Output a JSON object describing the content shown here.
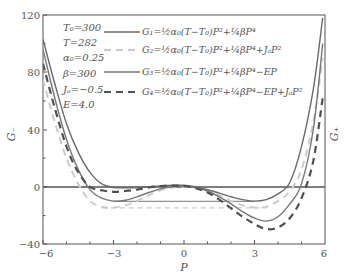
{
  "chart_data": {
    "type": "line",
    "title": "",
    "xlabel": "P",
    "ylabel": "G_",
    "ylabel_right": "G+",
    "xlim": [
      -6,
      6
    ],
    "ylim": [
      -40,
      120
    ],
    "xticks": [
      -6,
      -3,
      0,
      3,
      6
    ],
    "yticks": [
      -40,
      0,
      40,
      80,
      120
    ],
    "grid": false,
    "legend_position": "top-center",
    "parameters": [
      {
        "label": "T₀=300"
      },
      {
        "label": "T=282"
      },
      {
        "label": "α₀=0.25"
      },
      {
        "label": "β=300"
      },
      {
        "label": "Jₐ=−0.5"
      },
      {
        "label": "E=4.0"
      }
    ],
    "series": [
      {
        "name": "G₁ = ½α₀(T−T₀)P² + ¼βP⁴",
        "style": "solid",
        "color": "#666666",
        "x": [
          -6,
          -5.5,
          -5,
          -4.5,
          -4,
          -3.5,
          -3,
          -2.5,
          -2,
          -1.5,
          -1,
          -0.5,
          0,
          0.5,
          1,
          1.5,
          2,
          2.5,
          3,
          3.5,
          4,
          4.5,
          5,
          5.5,
          5.9
        ],
        "values": [
          103,
          72,
          44,
          24,
          10,
          2,
          -0.5,
          -0.8,
          -0.5,
          0,
          0.6,
          1,
          1,
          0,
          -2,
          -4.5,
          -7,
          -9,
          -10,
          -9,
          -5,
          3,
          28,
          68,
          118
        ]
      },
      {
        "name": "G₂ = ½α₀(T−T₀)P² + ¼βP⁴ + JₐP²",
        "style": "dashed",
        "color": "#c8c8c8",
        "x": [
          -6,
          -5.5,
          -5,
          -4.5,
          -4,
          -3.5,
          -3,
          -2.5,
          -2,
          -1.5,
          -1,
          -0.5,
          0,
          0.5,
          1,
          1.5,
          2,
          2.5,
          3,
          3.5,
          4,
          4.5,
          5,
          5.5,
          5.9
        ],
        "values": [
          75,
          45,
          20,
          2,
          -10,
          -14,
          -14.5,
          -13,
          -10,
          -6,
          -2.5,
          -0.5,
          0,
          -0.5,
          -2.5,
          -6,
          -10,
          -13,
          -14.5,
          -14,
          -10,
          -3,
          12,
          45,
          90
        ]
      },
      {
        "name": "G₃ = ½α₀(T−T₀)P² + ¼βP⁴ − EP",
        "style": "solid",
        "color": "#777777",
        "x": [
          -6,
          -5.5,
          -5,
          -4.5,
          -4,
          -3.5,
          -3,
          -2.5,
          -2,
          -1.5,
          -1,
          -0.5,
          0,
          0.5,
          1,
          1.5,
          2,
          2.5,
          3,
          3.5,
          4,
          4.5,
          5,
          5.5,
          5.9
        ],
        "values": [
          96,
          62,
          33,
          12,
          -2,
          -8,
          -10,
          -9.5,
          -7,
          -4,
          -1.5,
          0,
          0.5,
          -0.5,
          -3,
          -7,
          -12,
          -17.5,
          -22,
          -24,
          -21,
          -12,
          2,
          40,
          100
        ]
      },
      {
        "name": "G₄ = ½α₀(T−T₀)P² + ¼βP⁴ − EP + JₐP²",
        "style": "dashed",
        "color": "#555555",
        "x": [
          -6,
          -5.5,
          -5,
          -4.5,
          -4,
          -3.5,
          -3,
          -2.5,
          -2,
          -1.5,
          -1,
          -0.5,
          0,
          0.5,
          1,
          1.5,
          2,
          2.5,
          3,
          3.5,
          4,
          4.5,
          5,
          5.5,
          5.9
        ],
        "values": [
          86,
          55,
          28,
          10,
          0,
          -2.5,
          -3.5,
          -3,
          -2,
          -0.5,
          0.5,
          0.8,
          0.5,
          -1,
          -4,
          -9,
          -15,
          -21,
          -26,
          -29.5,
          -28.5,
          -22,
          -8,
          18,
          62
        ]
      }
    ],
    "reference_lines": [
      {
        "type": "horizontal",
        "y": 0,
        "color": "#555555",
        "label": "G=0 baseline"
      },
      {
        "type": "horizontal",
        "y": -10,
        "xfrom": -3,
        "xto": 3,
        "color": "#666666",
        "label": "G₁ minimum level"
      },
      {
        "type": "horizontal",
        "y": -14.5,
        "xfrom": -3.5,
        "xto": 3.5,
        "color": "#c8c8c8",
        "style": "dashed",
        "label": "G₂ minimum level"
      }
    ]
  },
  "legend": {
    "g1": {
      "lhs": "G₁",
      "eq": "=½α₀(T−T₀)P²+¼βP⁴"
    },
    "g2": {
      "lhs": "G₂",
      "eq": "=½α₀(T−T₀)P²+¼βP⁴+JₐP²"
    },
    "g3": {
      "lhs": "G₃",
      "eq": "=½α₀(T−T₀)P²+¼βP⁴−EP"
    },
    "g4": {
      "lhs": "G₄",
      "eq": "=½α₀(T−T₀)P²+¼βP⁴−EP+JₐP²"
    }
  },
  "axes": {
    "x_title": "P",
    "y_title_left": "G₋",
    "y_title_right": "G₊",
    "y_ticks": [
      "120",
      "80",
      "40",
      "0",
      "−40"
    ],
    "x_ticks": [
      "−6",
      "−3",
      "0",
      "3",
      "6"
    ]
  }
}
